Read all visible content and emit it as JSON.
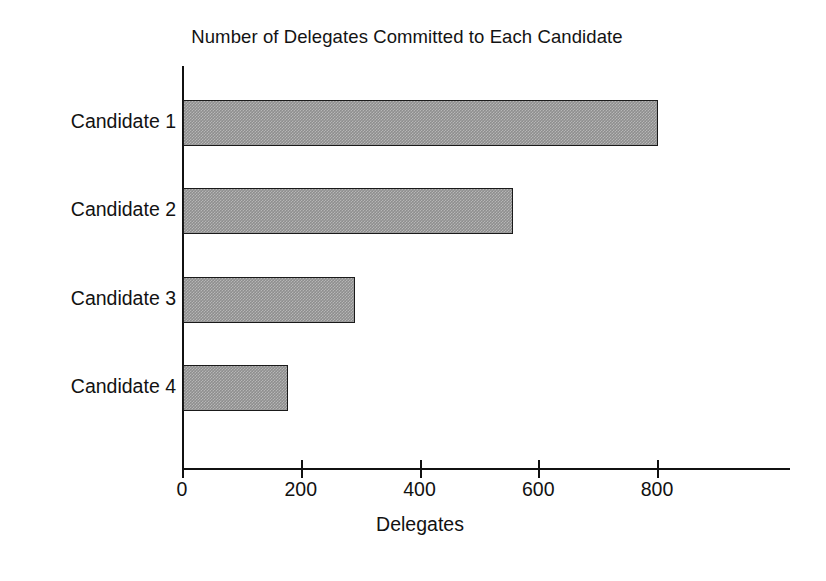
{
  "chart_data": {
    "type": "bar",
    "orientation": "horizontal",
    "title": "Number of Delegates Committed to Each Candidate",
    "xlabel": "Delegates",
    "ylabel": "",
    "categories": [
      "Candidate 1",
      "Candidate 2",
      "Candidate 3",
      "Candidate 4"
    ],
    "values": [
      800,
      555,
      290,
      177
    ],
    "series": [
      {
        "name": "Delegates",
        "values": [
          800,
          555,
          290,
          177
        ]
      }
    ],
    "xticks": [
      0,
      200,
      400,
      600,
      800
    ],
    "xtick_labels": [
      "0",
      "200",
      "400",
      "600",
      "800"
    ],
    "xlim": [
      0,
      1024
    ],
    "grid": false,
    "legend": false,
    "bar_fill_color": "#8e8e8e",
    "bar_edge_color": "#1a1a1a",
    "axis_color": "#111111",
    "background_color": "#ffffff"
  }
}
